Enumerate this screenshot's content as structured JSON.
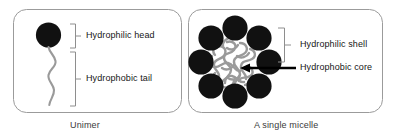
{
  "figure": {
    "background_color": "#ffffff",
    "panels": [
      {
        "id": "unimer",
        "caption": "Unimer",
        "shapes": {
          "head": {
            "name": "hydrophilic-head-circle",
            "color": "#111111"
          },
          "tail": {
            "name": "hydrophobic-tail-chain",
            "color": "#9a9a9a"
          }
        },
        "annotations": [
          {
            "id": "hydrophilic-head",
            "label": "Hydrophilic head",
            "bracket": true
          },
          {
            "id": "hydrophobic-tail",
            "label": "Hydrophobic tail",
            "bracket": true
          }
        ]
      },
      {
        "id": "micelle",
        "caption": "A single micelle",
        "shapes": {
          "shell_beads": {
            "name": "hydrophilic-shell-circles",
            "color": "#111111",
            "count": 8
          },
          "core": {
            "name": "hydrophobic-core-blob",
            "color": "#9a9a9a"
          }
        },
        "annotations": [
          {
            "id": "hydrophilic-shell",
            "label": "Hydrophilic shell",
            "bracket": true
          },
          {
            "id": "hydrophobic-core",
            "label": "Hydrophobic core",
            "arrow": true
          }
        ]
      }
    ],
    "colors": {
      "head_black": "#111111",
      "tail_gray": "#9a9a9a",
      "core_gray": "#9a9a9a",
      "panel_border": "#9b9b9b",
      "text": "#161616",
      "caption_text": "#3a3a3a",
      "leader_line": "#000000"
    }
  }
}
